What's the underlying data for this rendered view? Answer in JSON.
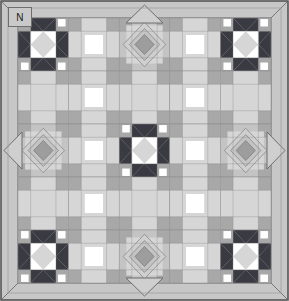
{
  "diagram": {
    "kind": "quilt-layout-diagram",
    "orientation_label": "N",
    "canvas": {
      "width": 289,
      "height": 301
    }
  },
  "palette": {
    "background": "#ffffff",
    "border_fill": "#c7c7c7",
    "sashing": "#c9c9c9",
    "light": "#ffffff",
    "pale": "#d6d6d6",
    "medium": "#a8a8a8",
    "mid_dark": "#8f8f8f",
    "dark": "#3a3a42",
    "outline": "#6e6e6e",
    "label_box": "#c9c9c9"
  },
  "layout": {
    "border_width": 18,
    "grid_rows": 5,
    "grid_cols": 5,
    "block_size": 50.6,
    "inner_origin_x": 18,
    "inner_origin_y": 18,
    "blocks": [
      [
        "star",
        "sashing",
        "medallion",
        "sashing",
        "star"
      ],
      [
        "sashing",
        "sashing",
        "sashing",
        "sashing",
        "sashing"
      ],
      [
        "medallion",
        "sashing",
        "star",
        "sashing",
        "medallion"
      ],
      [
        "sashing",
        "sashing",
        "sashing",
        "sashing",
        "sashing"
      ],
      [
        "star",
        "sashing",
        "medallion",
        "sashing",
        "star"
      ]
    ]
  },
  "edge_motifs": [
    {
      "name": "top-center-diamond",
      "edge": "top"
    },
    {
      "name": "bottom-center-diamond",
      "edge": "bottom"
    },
    {
      "name": "left-center-diamond",
      "edge": "left"
    },
    {
      "name": "right-center-diamond",
      "edge": "right"
    }
  ],
  "corner_motifs": [
    {
      "name": "top-left-corner-triangle"
    },
    {
      "name": "top-right-corner-triangle"
    },
    {
      "name": "bottom-left-corner-triangle"
    },
    {
      "name": "bottom-right-corner-triangle"
    }
  ]
}
